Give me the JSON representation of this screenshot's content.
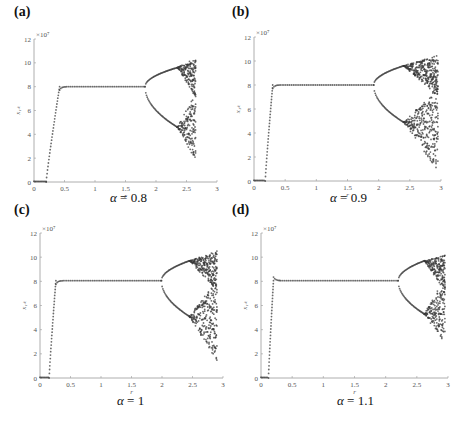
{
  "chart_data": [
    {
      "id": "a",
      "panel_label": "(a)",
      "type": "scatter",
      "title": "α = 0.8",
      "alpha_symbol": "α",
      "alpha_value": "0.8",
      "xlabel": "r",
      "ylabel": "x_1k",
      "y_multiplier": "×10⁷",
      "xlim": [
        0,
        3
      ],
      "ylim": [
        0,
        12
      ],
      "xticks": [
        "0",
        "0.5",
        "1",
        "1.5",
        "2",
        "2.5",
        "3"
      ],
      "yticks": [
        "0",
        "2",
        "4",
        "6",
        "8",
        "10",
        "12"
      ],
      "grid": false,
      "rise_start_r": 0.2,
      "rise_end_r": 0.42,
      "plateau_value": 8.0,
      "overshoot": 0,
      "bifurcation_r": 1.82,
      "period4_r": 2.35,
      "upper_at_period4": 9.6,
      "lower_at_period4": 4.6,
      "chaos_end_r": 2.65,
      "chaos_max": 10.4,
      "chaos_min": 1.8
    },
    {
      "id": "b",
      "panel_label": "(b)",
      "type": "scatter",
      "title": "α = 0.9",
      "alpha_symbol": "α",
      "alpha_value": "0.9",
      "xlabel": "r",
      "ylabel": "x_1k",
      "y_multiplier": "×10⁷",
      "xlim": [
        0,
        3
      ],
      "ylim": [
        0,
        12
      ],
      "xticks": [
        "0",
        "0.5",
        "1",
        "1.5",
        "2",
        "2.5",
        "3"
      ],
      "yticks": [
        "0",
        "2",
        "4",
        "6",
        "8",
        "10",
        "12"
      ],
      "grid": false,
      "rise_start_r": 0.18,
      "rise_end_r": 0.3,
      "plateau_value": 8.0,
      "overshoot": 0,
      "bifurcation_r": 1.92,
      "period4_r": 2.4,
      "upper_at_period4": 9.6,
      "lower_at_period4": 4.9,
      "chaos_end_r": 2.95,
      "chaos_max": 10.5,
      "chaos_min": 0.8
    },
    {
      "id": "c",
      "panel_label": "(c)",
      "type": "scatter",
      "title": "α = 1",
      "alpha_symbol": "α",
      "alpha_value": "1",
      "xlabel": "r",
      "ylabel": "x_1k",
      "y_multiplier": "×10⁷",
      "xlim": [
        0,
        3
      ],
      "ylim": [
        0,
        12
      ],
      "xticks": [
        "0",
        "0.5",
        "1",
        "1.5",
        "2",
        "2.5",
        "3"
      ],
      "yticks": [
        "0",
        "2",
        "4",
        "6",
        "8",
        "10",
        "12"
      ],
      "grid": false,
      "rise_start_r": 0.15,
      "rise_end_r": 0.26,
      "plateau_value": 8.05,
      "overshoot": 0,
      "bifurcation_r": 1.99,
      "period4_r": 2.45,
      "upper_at_period4": 9.7,
      "lower_at_period4": 5.1,
      "chaos_end_r": 2.9,
      "chaos_max": 10.5,
      "chaos_min": 1.4
    },
    {
      "id": "d",
      "panel_label": "(d)",
      "type": "scatter",
      "title": "α = 1.1",
      "alpha_symbol": "α",
      "alpha_value": "1.1",
      "xlabel": "r",
      "ylabel": "x_1k",
      "y_multiplier": "×10⁷",
      "xlim": [
        0,
        3
      ],
      "ylim": [
        0,
        12
      ],
      "xticks": [
        "0",
        "0.5",
        "1",
        "1.5",
        "2",
        "2.5",
        "3"
      ],
      "yticks": [
        "0",
        "2",
        "4",
        "6",
        "8",
        "10",
        "12"
      ],
      "grid": false,
      "rise_start_r": 0.12,
      "rise_end_r": 0.2,
      "plateau_value": 8.05,
      "overshoot": 0.3,
      "bifurcation_r": 2.2,
      "period4_r": 2.62,
      "upper_at_period4": 9.7,
      "lower_at_period4": 5.3,
      "chaos_end_r": 2.95,
      "chaos_max": 10.2,
      "chaos_min": 2.8
    }
  ],
  "layout": {
    "panels": [
      {
        "left": 0,
        "top": 0,
        "axis_x0": 34,
        "axis_x3": 217,
        "axis_y0": 182,
        "axis_y12": 39,
        "label_x": 14,
        "label_y": 4,
        "caption_x": 110,
        "caption_y": 190
      },
      {
        "left": 0,
        "top": 0,
        "axis_x0": 254,
        "axis_x3": 441,
        "axis_y0": 181,
        "axis_y12": 37,
        "label_x": 232,
        "label_y": 4,
        "caption_x": 330,
        "caption_y": 190
      },
      {
        "left": 0,
        "top": 0,
        "axis_x0": 40,
        "axis_x3": 223,
        "axis_y0": 378,
        "axis_y12": 233,
        "label_x": 14,
        "label_y": 202,
        "caption_x": 117,
        "caption_y": 393
      },
      {
        "left": 0,
        "top": 0,
        "axis_x0": 261,
        "axis_x3": 448,
        "axis_y0": 378,
        "axis_y12": 233,
        "label_x": 232,
        "label_y": 202,
        "caption_x": 337,
        "caption_y": 393
      }
    ],
    "axis_color": "#9a9a9a",
    "point_color": "#3a3a3a"
  }
}
